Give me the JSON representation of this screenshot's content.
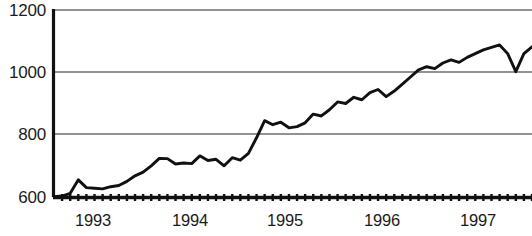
{
  "chart_data": {
    "type": "line",
    "title": "",
    "subtitle": "",
    "xlabel": "",
    "ylabel": "",
    "ylim": [
      600,
      1200
    ],
    "xlim": [
      "1993-01",
      "1997-12"
    ],
    "grid": true,
    "grid_axis": "y",
    "legend": false,
    "legend_position": "none",
    "y_ticks": [
      600,
      800,
      1000,
      1200
    ],
    "y_tick_labels": [
      "600",
      "800",
      "1000",
      "1200"
    ],
    "x_ticks": [
      "1993",
      "1994",
      "1995",
      "1996",
      "1997"
    ],
    "x_tick_labels": [
      "1993",
      "1994",
      "1995",
      "1996",
      "1997"
    ],
    "x_minor_ticks": "monthly",
    "line_color": "#111111",
    "grid_color": "#6e6e6e",
    "axis_color": "#111111",
    "background_color": "#ffffff",
    "series": [
      {
        "name": "Index level",
        "x": [
          "1993-01",
          "1993-02",
          "1993-03",
          "1993-04",
          "1993-05",
          "1993-06",
          "1993-07",
          "1993-08",
          "1993-09",
          "1993-10",
          "1993-11",
          "1993-12",
          "1994-01",
          "1994-02",
          "1994-03",
          "1994-04",
          "1994-05",
          "1994-06",
          "1994-07",
          "1994-08",
          "1994-09",
          "1994-10",
          "1994-11",
          "1994-12",
          "1995-01",
          "1995-02",
          "1995-03",
          "1995-04",
          "1995-05",
          "1995-06",
          "1995-07",
          "1995-08",
          "1995-09",
          "1995-10",
          "1995-11",
          "1995-12",
          "1996-01",
          "1996-02",
          "1996-03",
          "1996-04",
          "1996-05",
          "1996-06",
          "1996-07",
          "1996-08",
          "1996-09",
          "1996-10",
          "1996-11",
          "1996-12",
          "1997-01",
          "1997-02",
          "1997-03",
          "1997-04",
          "1997-05",
          "1997-06",
          "1997-07",
          "1997-08",
          "1997-09",
          "1997-10",
          "1997-11",
          "1997-12"
        ],
        "values": [
          601,
          603,
          612,
          655,
          630,
          628,
          626,
          633,
          637,
          650,
          668,
          680,
          700,
          724,
          723,
          706,
          709,
          707,
          732,
          717,
          721,
          700,
          726,
          718,
          740,
          790,
          845,
          832,
          840,
          822,
          826,
          838,
          866,
          860,
          880,
          905,
          900,
          920,
          912,
          935,
          945,
          922,
          940,
          962,
          985,
          1008,
          1018,
          1012,
          1030,
          1040,
          1032,
          1048,
          1060,
          1072,
          1080,
          1088,
          1060,
          1002,
          1060,
          1082
        ]
      }
    ],
    "notes": [
      "Monthly minor tick marks along the x-axis",
      "Sharp drop near late 1997 returning to the 1000 gridline"
    ]
  }
}
